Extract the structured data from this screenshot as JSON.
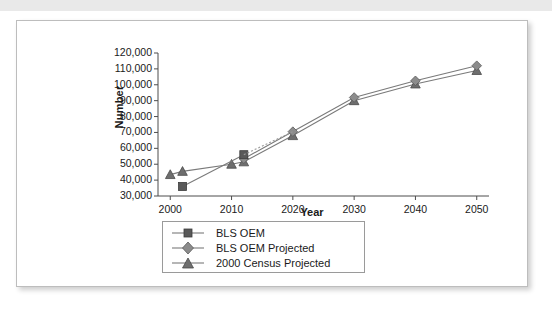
{
  "chart_data": {
    "type": "line",
    "title": "",
    "subtitle": "",
    "xlabel": "Year",
    "ylabel": "Number",
    "xlim": [
      1998,
      2052
    ],
    "ylim": [
      30000,
      120000
    ],
    "grid": false,
    "legend_position": "bottom-center",
    "x_ticks": [
      "2000",
      "2010",
      "2020",
      "2030",
      "2040",
      "2050"
    ],
    "x_tick_values": [
      2000,
      2010,
      2020,
      2030,
      2040,
      2050
    ],
    "y_ticks": [
      "30,000",
      "40,000",
      "50,000",
      "60,000",
      "70,000",
      "80,000",
      "90,000",
      "100,000",
      "110,000",
      "120,000"
    ],
    "y_tick_values": [
      30000,
      40000,
      50000,
      60000,
      70000,
      80000,
      90000,
      100000,
      110000,
      120000
    ],
    "series": [
      {
        "name": "BLS OEM",
        "marker": "square",
        "color": "#595959",
        "x": [
          2002,
          2012
        ],
        "values": [
          36000,
          56000
        ]
      },
      {
        "name": "BLS OEM Projected",
        "marker": "diamond",
        "color": "#8c8c8c",
        "x": [
          2012,
          2020,
          2030,
          2040,
          2050
        ],
        "values": [
          53500,
          70500,
          92000,
          102500,
          112000
        ]
      },
      {
        "name": "2000 Census Projected",
        "marker": "triangle",
        "color": "#6e6e6e",
        "x": [
          2000,
          2002,
          2010,
          2012,
          2020,
          2030,
          2040,
          2050
        ],
        "values": [
          43500,
          45500,
          50000,
          51500,
          68000,
          90000,
          100500,
          109000
        ]
      }
    ]
  },
  "legend": {
    "entries": [
      {
        "label": "BLS OEM",
        "marker": "square"
      },
      {
        "label": "BLS OEM Projected",
        "marker": "diamond"
      },
      {
        "label": "2000 Census Projected",
        "marker": "triangle"
      }
    ]
  },
  "colors": {
    "panel_border": "#bdbdbd",
    "top_bar": "#e9e9e9",
    "axis": "#4d4d4d",
    "text": "#1a1a1a"
  }
}
